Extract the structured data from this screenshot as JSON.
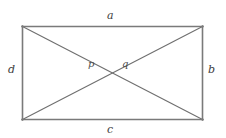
{
  "figure": {
    "kind": "geometry-diagram",
    "background_color": "#ffffff",
    "stroke_color": "#7a7a7a",
    "diagonal_color": "#6f6f6f",
    "label_color": "#3d3d3d",
    "stroke_width": 1.4,
    "diagonal_width": 1.1,
    "rect": {
      "x1": 22,
      "y1": 26,
      "x2": 203,
      "y2": 120,
      "width": 181,
      "height": 94
    },
    "center": {
      "x": 112.5,
      "y": 73
    },
    "sides": [
      {
        "id": "top",
        "label": "a"
      },
      {
        "id": "right",
        "label": "b"
      },
      {
        "id": "bottom",
        "label": "c"
      },
      {
        "id": "left",
        "label": "d"
      }
    ],
    "segments": [
      {
        "id": "diagonal-left-segment",
        "label": "p"
      },
      {
        "id": "diagonal-right-segment",
        "label": "q"
      }
    ],
    "labels": {
      "top_side": "a",
      "right_side": "b",
      "bottom_side": "c",
      "left_side": "d",
      "left_diagonal_segment": "p",
      "right_diagonal_segment": "q"
    }
  }
}
